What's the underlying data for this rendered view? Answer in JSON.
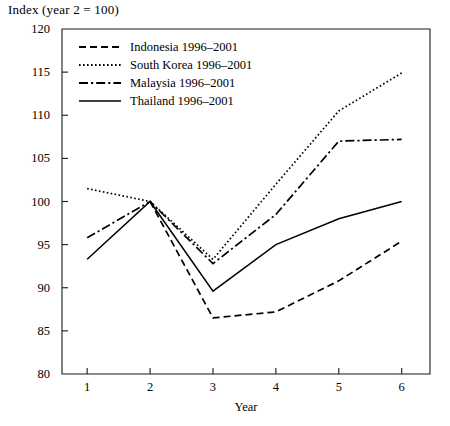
{
  "chart_data": {
    "type": "line",
    "title": "Index (year 2 = 100)",
    "xlabel": "Year",
    "ylabel": "",
    "x": [
      1,
      2,
      3,
      4,
      5,
      6
    ],
    "xtick_labels": [
      "1",
      "2",
      "3",
      "4",
      "5",
      "6"
    ],
    "ytick_labels": [
      "80",
      "85",
      "90",
      "95",
      "100",
      "105",
      "110",
      "115",
      "120"
    ],
    "yticks": [
      80,
      85,
      90,
      95,
      100,
      105,
      110,
      115,
      120
    ],
    "xlim": [
      0.6,
      6.45
    ],
    "ylim": [
      80,
      120
    ],
    "grid": false,
    "legend_position": "top-left inside",
    "series": [
      {
        "name": "Indonesia 1996–2001",
        "style": "dashed",
        "values": [
          null,
          100,
          86.5,
          87.2,
          90.8,
          95.4
        ]
      },
      {
        "name": "South Korea 1996–2001",
        "style": "dotted",
        "values": [
          101.5,
          100,
          93.3,
          102.0,
          110.5,
          114.9
        ]
      },
      {
        "name": "Malaysia 1996–2001",
        "style": "dash-dot",
        "values": [
          95.8,
          100,
          92.8,
          98.5,
          107.0,
          107.2
        ]
      },
      {
        "name": "Thailand 1996–2001",
        "style": "solid",
        "values": [
          93.3,
          100,
          89.6,
          95.0,
          98.0,
          100.0
        ]
      }
    ],
    "colors": {
      "line": "#000000",
      "axis": "#000000",
      "background": "#ffffff"
    }
  }
}
